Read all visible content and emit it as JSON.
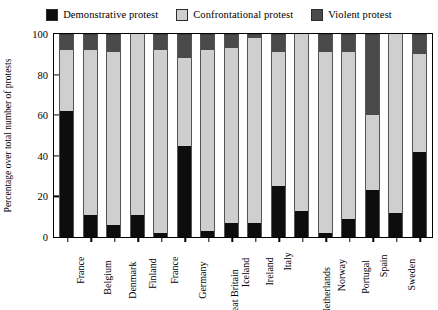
{
  "chart_data": {
    "type": "bar",
    "subtype": "stacked-100-percent",
    "title": "",
    "xlabel": "",
    "ylabel": "Percentage over total number of protests",
    "ylim": [
      0,
      100
    ],
    "yticks": [
      0,
      20,
      40,
      60,
      80,
      100
    ],
    "grid": false,
    "legend_position": "top-center",
    "categories": [
      "France",
      "Belgium",
      "Denmark",
      "Finland",
      "France",
      "Germany",
      "Great Britain",
      "Iceland",
      "Ireland",
      "Italy",
      "Netherlands",
      "Norway",
      "Portugal",
      "Spain",
      "Sweden",
      "Switzerland"
    ],
    "series": [
      {
        "name": "Demonstrative protest",
        "color": "#0d0d0d",
        "values": [
          62,
          11,
          6,
          11,
          2,
          45,
          3,
          7,
          7,
          25,
          13,
          2,
          9,
          23,
          12,
          42
        ]
      },
      {
        "name": "Confrontational protest",
        "color": "#cfcfcf",
        "values": [
          30,
          81,
          85,
          89,
          90,
          43,
          89,
          86,
          91,
          66,
          87,
          89,
          82,
          37,
          88,
          48
        ]
      },
      {
        "name": "Violent protest",
        "color": "#4a4a4a",
        "values": [
          8,
          8,
          9,
          0,
          8,
          12,
          8,
          7,
          2,
          9,
          0,
          9,
          9,
          40,
          0,
          10
        ]
      }
    ]
  },
  "legend": {
    "entries": [
      {
        "label": "Demonstrative protest",
        "color": "#0d0d0d"
      },
      {
        "label": "Confrontational protest",
        "color": "#cfcfcf"
      },
      {
        "label": "Violent protest",
        "color": "#4a4a4a"
      }
    ]
  }
}
